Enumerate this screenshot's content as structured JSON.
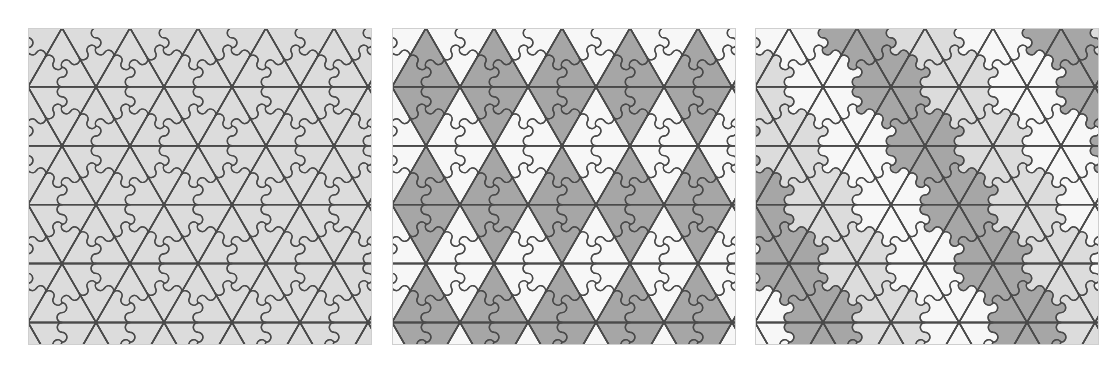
{
  "figure": {
    "background": "#ffffff",
    "panel_count": 3
  },
  "palette": {
    "stroke": "#4a4a4a",
    "light_gray": "#dcdcdc",
    "dark_gray": "#a6a6a6",
    "white": "#f7f7f7",
    "off_white": "#efefef",
    "panel_border": "#cfcfcf"
  },
  "geometry": {
    "triangle_half_width": 34,
    "triangle_height": 58.89,
    "grid_rows": 7,
    "grid_cols": 7,
    "stroke_width": 1.4,
    "arc_ratio": 0.5
  },
  "panels": [
    {
      "id": "panel-uniform",
      "label": "Uniform light-grey colouring",
      "x": 28,
      "y": 28,
      "width": 344,
      "height": 317,
      "coloring": "uniform",
      "colors": [
        "#dcdcdc"
      ],
      "legend": "All pieces share one light-grey tone; only the outlines show the pinwheel decomposition."
    },
    {
      "id": "panel-two-tone",
      "label": "Two-tone alternating triangle colouring",
      "x": 392,
      "y": 28,
      "width": 344,
      "height": 317,
      "coloring": "alternating-triangles",
      "colors": [
        "#a6a6a6",
        "#f7f7f7"
      ],
      "legend": "Upward and downward triangles alternate dark grey and white."
    },
    {
      "id": "panel-rosette",
      "label": "Three-colour rosette colouring",
      "x": 755,
      "y": 28,
      "width": 344,
      "height": 317,
      "coloring": "rosettes",
      "colors": [
        "#a6a6a6",
        "#f7f7f7",
        "#dcdcdc"
      ],
      "legend": "Six pieces meeting at a vertex form a flower; flowers are coloured in a repeating three-colour scheme."
    }
  ]
}
